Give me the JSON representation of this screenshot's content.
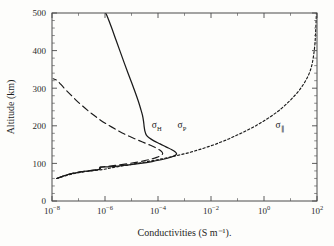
{
  "figure": {
    "background_color": "#fdfdfb",
    "line_color": "#1a1a1a",
    "axis_color": "#4a4a4a"
  },
  "chart_data": {
    "type": "line",
    "title": "",
    "xlabel": "Conductivities (S m⁻¹).",
    "ylabel": "Altitude (km)",
    "xscale": "log",
    "yscale": "linear",
    "xlim": [
      1e-08,
      100.0
    ],
    "ylim": [
      0,
      500
    ],
    "grid": false,
    "legend_position": "inline-annotations",
    "xticks": [
      1e-08,
      1e-06,
      0.0001,
      0.01,
      1.0,
      100.0
    ],
    "xtick_labels": [
      "10−8",
      "10−6",
      "10−4",
      "10−2",
      "10⁰",
      "10²"
    ],
    "xtick_mantissas": [
      "10",
      "10",
      "10",
      "10",
      "10",
      "10"
    ],
    "xtick_exponents": [
      "-8",
      "-6",
      "-4",
      "-2",
      "0",
      "2"
    ],
    "yticks": [
      0,
      100,
      200,
      300,
      400,
      500
    ],
    "ytick_labels": [
      "0",
      "100",
      "200",
      "300",
      "400",
      "500"
    ],
    "yminor_step": 20,
    "series": [
      {
        "name": "sigma_P",
        "label": "σ",
        "label_sub": "P",
        "style": "solid",
        "annotation_x": 0.0008,
        "annotation_y": 193,
        "comment": "Pedersen conductivity; altitude (km) vs conductivity (S/m)",
        "points": [
          [
            1.55e-08,
            60
          ],
          [
            2.2e-08,
            64
          ],
          [
            3.2e-08,
            68
          ],
          [
            5e-08,
            72
          ],
          [
            8e-08,
            75
          ],
          [
            1.4e-07,
            78
          ],
          [
            2.4e-07,
            80
          ],
          [
            4e-07,
            82
          ],
          [
            6.2e-07,
            84
          ],
          [
            6.6e-07,
            86
          ],
          [
            6.8e-07,
            88
          ],
          [
            7e-07,
            90
          ],
          [
            1.3e-06,
            91
          ],
          [
            3e-06,
            93
          ],
          [
            8e-06,
            96
          ],
          [
            2.2e-05,
            100
          ],
          [
            6e-05,
            105
          ],
          [
            0.00016,
            111
          ],
          [
            0.00032,
            117
          ],
          [
            0.00046,
            122
          ],
          [
            0.0005,
            126
          ],
          [
            0.00044,
            131
          ],
          [
            0.00032,
            137
          ],
          [
            0.0002,
            144
          ],
          [
            0.00012,
            152
          ],
          [
            7e-05,
            160
          ],
          [
            4.6e-05,
            168
          ],
          [
            3.6e-05,
            176
          ],
          [
            3.2e-05,
            186
          ],
          [
            3e-05,
            198
          ],
          [
            2.85e-05,
            212
          ],
          [
            2.6e-05,
            228
          ],
          [
            2.2e-05,
            246
          ],
          [
            1.8e-05,
            266
          ],
          [
            1.4e-05,
            288
          ],
          [
            1.05e-05,
            312
          ],
          [
            7.6e-06,
            338
          ],
          [
            5.4e-06,
            366
          ],
          [
            3.8e-06,
            396
          ],
          [
            2.6e-06,
            428
          ],
          [
            1.75e-06,
            462
          ],
          [
            1.2e-06,
            492
          ],
          [
            1.05e-06,
            500
          ]
        ]
      },
      {
        "name": "sigma_H",
        "label": "σ",
        "label_sub": "H",
        "style": "dashed",
        "annotation_x": 9e-05,
        "annotation_y": 193,
        "comment": "Hall conductivity",
        "points": [
          [
            1.5e-08,
            60
          ],
          [
            2.1e-08,
            64
          ],
          [
            3.1e-08,
            68
          ],
          [
            4.8e-08,
            72
          ],
          [
            7.6e-08,
            75
          ],
          [
            1.3e-07,
            78
          ],
          [
            2.3e-07,
            80
          ],
          [
            3.8e-07,
            82
          ],
          [
            5.8e-07,
            84
          ],
          [
            6.2e-07,
            86
          ],
          [
            6.4e-07,
            88
          ],
          [
            6.6e-07,
            90
          ],
          [
            1.2e-06,
            92
          ],
          [
            2.8e-06,
            95
          ],
          [
            7e-06,
            99
          ],
          [
            1.9e-05,
            104
          ],
          [
            4.6e-05,
            110
          ],
          [
            9e-05,
            116
          ],
          [
            0.000135,
            122
          ],
          [
            0.00015,
            127
          ],
          [
            0.00013,
            133
          ],
          [
            9e-05,
            140
          ],
          [
            5.2e-05,
            148
          ],
          [
            2.6e-05,
            157
          ],
          [
            1.2e-05,
            167
          ],
          [
            5.4e-06,
            178
          ],
          [
            2.6e-06,
            190
          ],
          [
            1.25e-06,
            203
          ],
          [
            6.2e-07,
            217
          ],
          [
            3.2e-07,
            232
          ],
          [
            1.7e-07,
            248
          ],
          [
            9e-08,
            265
          ],
          [
            5e-08,
            283
          ],
          [
            2.8e-08,
            301
          ],
          [
            1.6e-08,
            320
          ],
          [
            1.1e-08,
            325
          ]
        ]
      },
      {
        "name": "sigma_parallel",
        "label": "σ",
        "label_sub": "∥",
        "style": "dotted",
        "annotation_x": 4.0,
        "annotation_y": 193,
        "comment": "Parallel (field-aligned) conductivity",
        "points": [
          [
            1.5e-08,
            60
          ],
          [
            2.3e-08,
            64
          ],
          [
            3.6e-08,
            68
          ],
          [
            6e-08,
            72
          ],
          [
            1e-07,
            75
          ],
          [
            1.8e-07,
            78
          ],
          [
            3.2e-07,
            80
          ],
          [
            5.6e-07,
            82
          ],
          [
            8.6e-07,
            84
          ],
          [
            1.2e-06,
            86
          ],
          [
            1.7e-06,
            88
          ],
          [
            2.4e-06,
            90
          ],
          [
            4.2e-06,
            93
          ],
          [
            8e-06,
            96
          ],
          [
            1.6e-05,
            100
          ],
          [
            3.4e-05,
            104
          ],
          [
            7e-05,
            108
          ],
          [
            0.00014,
            112
          ],
          [
            0.00026,
            116
          ],
          [
            0.00046,
            120
          ],
          [
            0.0008,
            124
          ],
          [
            0.0014,
            128
          ],
          [
            0.0024,
            133
          ],
          [
            0.0042,
            138
          ],
          [
            0.0075,
            144
          ],
          [
            0.0135,
            150
          ],
          [
            0.024,
            157
          ],
          [
            0.043,
            164
          ],
          [
            0.076,
            172
          ],
          [
            0.135,
            180
          ],
          [
            0.24,
            189
          ],
          [
            0.43,
            198
          ],
          [
            0.76,
            208
          ],
          [
            1.35,
            219
          ],
          [
            2.4,
            231
          ],
          [
            4.2,
            244
          ],
          [
            7.0,
            258
          ],
          [
            11.5,
            273
          ],
          [
            18.5,
            289
          ],
          [
            28.0,
            306
          ],
          [
            40.0,
            324
          ],
          [
            54.0,
            344
          ],
          [
            66.0,
            366
          ],
          [
            76.0,
            392
          ],
          [
            84.0,
            420
          ],
          [
            89.0,
            452
          ],
          [
            93.0,
            482
          ],
          [
            95.0,
            500
          ]
        ]
      }
    ]
  }
}
